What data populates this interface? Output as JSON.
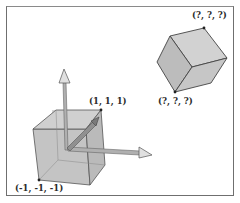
{
  "figure": {
    "left_cube": {
      "corner_labels": {
        "max": "(1, 1, 1)",
        "min": "(-1, -1, -1)"
      },
      "face_color": "#c4c4c4",
      "edge_color": "#555555"
    },
    "right_cube": {
      "corner_labels": {
        "top": "(?, ?, ?)",
        "bottom": "(?, ?, ?)"
      },
      "face_color": "#c8c8c8",
      "edge_color": "#444444"
    },
    "axes": {
      "color": "#a8a8a8",
      "count": 3
    },
    "frame_color": "#6f6f6f"
  }
}
